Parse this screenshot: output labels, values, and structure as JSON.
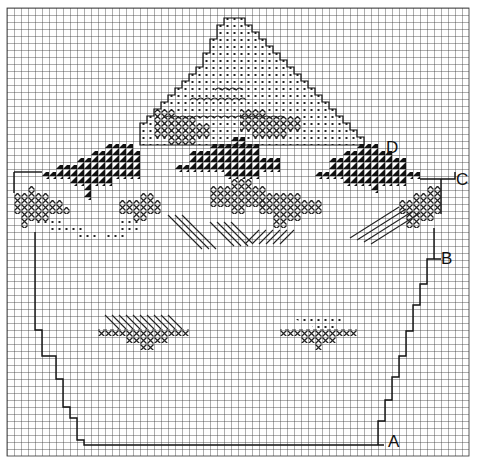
{
  "diagram": {
    "type": "cross-stitch chart",
    "grid": {
      "cols": 66,
      "rows": 64,
      "cell": 7,
      "origin_x": 7,
      "origin_y": 8,
      "line_color": "#333333"
    },
    "labels": [
      {
        "text": "A",
        "x": 388,
        "y": 433
      },
      {
        "text": "B",
        "x": 441,
        "y": 250
      },
      {
        "text": "C",
        "x": 456,
        "y": 171
      },
      {
        "text": "D",
        "x": 386,
        "y": 139
      }
    ],
    "legend_symbols": {
      "dot": "light fill (dotted squares)",
      "cross": "cross stitch (x)",
      "half": "dark half-triangle stitch",
      "diag": "diagonal backstitch lines"
    }
  }
}
